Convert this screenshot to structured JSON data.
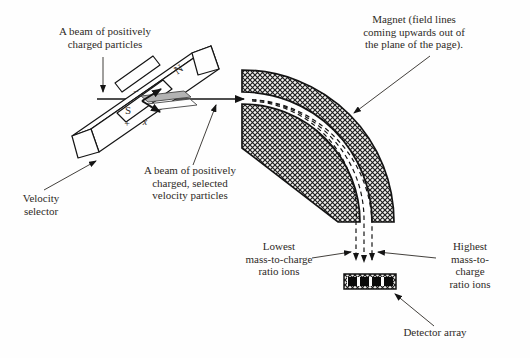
{
  "labels": {
    "beam_source": "A beam of positively\ncharged particles",
    "magnet": "Magnet (field lines\ncoming upwards out of\nthe plane of the page).",
    "selected_beam": "A beam of positively\ncharged, selected\nvelocity particles",
    "velocity_selector": "Velocity\nselector",
    "lowest_ions": "Lowest\nmass-to-charge\nratio ions",
    "highest_ions": "Highest\nmass-to-charge\nratio ions",
    "detector": "Detector array"
  },
  "selector_symbols": {
    "north_pole": "N",
    "south_pole": "S",
    "minus_plate": "−",
    "plus_plate": "+",
    "field_into_page": "x"
  },
  "colors": {
    "ink": "#2e2a26",
    "outline": "#141414",
    "plate_gray": "#b3b3b3",
    "paper": "#fefefe"
  }
}
